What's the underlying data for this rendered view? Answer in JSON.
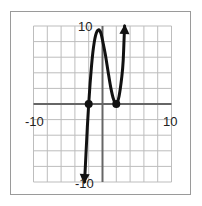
{
  "chart_data": {
    "type": "line",
    "title": "",
    "xlabel": "",
    "ylabel": "",
    "xlim": [
      -10,
      10
    ],
    "ylim": [
      -10,
      10
    ],
    "grid": true,
    "grid_step": 2,
    "tick_labels": {
      "x_min": "-10",
      "x_max": "10",
      "y_max": "10",
      "y_min": "-10"
    },
    "series": [
      {
        "name": "cubic curve",
        "description": "sketch of y = a(x+2)(x-2)^2 with arrows at both ends",
        "x": [
          -2.6,
          -2.4,
          -2.2,
          -2.0,
          -1.8,
          -1.6,
          -1.4,
          -1.2,
          -1.0,
          -0.8,
          -0.6,
          -0.4,
          -0.2,
          0.0,
          0.4,
          0.8,
          1.2,
          1.6,
          2.0,
          2.4,
          2.8,
          3.0,
          3.2
        ],
        "y": [
          -10,
          -6.5,
          -3.0,
          0,
          2.6,
          4.8,
          6.6,
          7.9,
          8.8,
          9.3,
          9.5,
          9.4,
          9.0,
          8.2,
          6.4,
          4.2,
          2.1,
          0.6,
          0,
          1.0,
          3.5,
          5.6,
          10
        ],
        "arrows": [
          "start",
          "end"
        ],
        "color": "#111111"
      }
    ],
    "points": [
      {
        "x": -2,
        "y": 0,
        "label": ""
      },
      {
        "x": 2,
        "y": 0,
        "label": ""
      }
    ]
  },
  "labels": {
    "x_min": "-10",
    "x_max": "10",
    "y_max": "10",
    "y_min": "-10"
  },
  "colors": {
    "grid": "#bdbdbd",
    "axis": "#666666",
    "curve": "#111111",
    "border": "#9a9a9a"
  }
}
